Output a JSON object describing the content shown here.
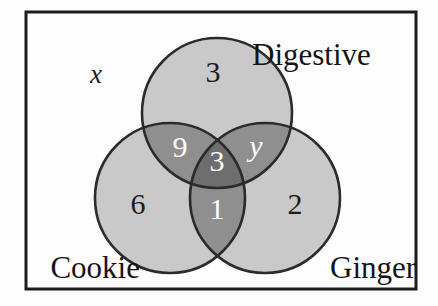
{
  "diagram": {
    "type": "venn-3-set",
    "universe_label": "x",
    "border_color": "#1c1c1c",
    "background_color": "#fdfdfd",
    "fill_single": "#c9c9c9",
    "fill_pair": "#8f8f8f",
    "fill_triple": "#6e6e6e",
    "outline_color": "#2b2b2b"
  },
  "sets": [
    {
      "id": "digestive",
      "label": "Digestive",
      "cx": 217,
      "cy": 113,
      "r": 75
    },
    {
      "id": "cookie",
      "label": "Cookie",
      "cx": 170,
      "cy": 198,
      "r": 75
    },
    {
      "id": "ginger",
      "label": "Ginger",
      "cx": 265,
      "cy": 198,
      "r": 75
    }
  ],
  "set_label_positions": [
    {
      "id": "digestive",
      "x": 252,
      "y": 58,
      "anchor": "start"
    },
    {
      "id": "cookie",
      "x": 140,
      "y": 271,
      "anchor": "end"
    },
    {
      "id": "ginger",
      "x": 330,
      "y": 271,
      "anchor": "start"
    }
  ],
  "regions": [
    {
      "id": "digestive-only",
      "value": "3",
      "x": 213,
      "y": 75,
      "tone": "single",
      "text": "dark",
      "italic": false
    },
    {
      "id": "cookie-only",
      "value": "6",
      "x": 138,
      "y": 207,
      "tone": "single",
      "text": "dark",
      "italic": false
    },
    {
      "id": "ginger-only",
      "value": "2",
      "x": 295,
      "y": 207,
      "tone": "single",
      "text": "dark",
      "italic": false
    },
    {
      "id": "cookie-digestive",
      "value": "9",
      "x": 180,
      "y": 150,
      "tone": "pair",
      "text": "light",
      "italic": false
    },
    {
      "id": "digestive-ginger",
      "value": "y",
      "x": 256,
      "y": 149,
      "tone": "pair",
      "text": "light",
      "italic": true
    },
    {
      "id": "cookie-ginger",
      "value": "1",
      "x": 217,
      "y": 212,
      "tone": "pair",
      "text": "light",
      "italic": false
    },
    {
      "id": "cookie-digestive-ginger",
      "value": "3",
      "x": 217,
      "y": 164,
      "tone": "triple",
      "text": "light",
      "italic": false
    }
  ],
  "universe": {
    "label": "x",
    "x": 96,
    "y": 77
  },
  "border_rect": {
    "x": 26,
    "y": 12,
    "width": 390,
    "height": 277,
    "stroke_width": 3
  }
}
